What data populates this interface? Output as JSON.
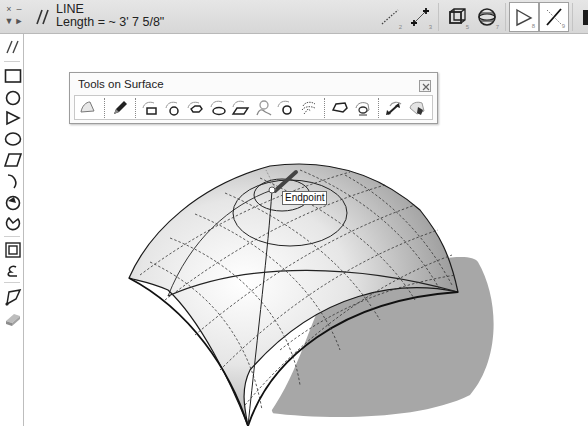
{
  "topbar": {
    "mini_controls": [
      "×",
      "–",
      "▼",
      "►"
    ],
    "tool_name": "LINE",
    "measurement": "Length = ~ 3' 7 5/8\"",
    "right_tools": [
      {
        "id": "line-dotted",
        "icon": "dotted-line-icon",
        "sub": "2",
        "active": false
      },
      {
        "id": "line-endpoints",
        "icon": "line-endpoints-icon",
        "sub": "3",
        "active": false
      },
      {
        "id": "box-3d",
        "icon": "box-3d-icon",
        "sub": "5",
        "active": false
      },
      {
        "id": "sphere",
        "icon": "sphere-icon",
        "sub": "7",
        "active": false
      },
      {
        "id": "triangle",
        "icon": "triangle-icon",
        "sub": "8",
        "active": true
      },
      {
        "id": "line-cross",
        "icon": "line-cross-icon",
        "sub": "9",
        "active": true
      },
      {
        "id": "solid-box",
        "icon": "solid-box-icon",
        "sub": "",
        "active": false
      }
    ]
  },
  "left_toolbar": {
    "items": [
      {
        "name": "line-tool",
        "icon": "double-slash-icon"
      },
      {
        "name": "rectangle-tool",
        "icon": "rectangle-icon"
      },
      {
        "name": "circle-tool",
        "icon": "circle-icon"
      },
      {
        "name": "polygon-tool",
        "icon": "triangle-icon"
      },
      {
        "name": "ellipse-tool",
        "icon": "ellipse-icon"
      },
      {
        "name": "parallelogram-tool",
        "icon": "parallelogram-icon"
      },
      {
        "name": "arc-tool",
        "icon": "arc-icon"
      },
      {
        "name": "circle-arc-tool",
        "icon": "circle-segment-icon"
      },
      {
        "name": "pie-tool",
        "icon": "pie-icon"
      },
      {
        "name": "offset-tool",
        "icon": "offset-square-icon"
      },
      {
        "name": "freehand-tool",
        "icon": "freehand-icon"
      },
      {
        "name": "polyline-tool",
        "icon": "polyline-icon"
      },
      {
        "name": "eraser-tool",
        "icon": "eraser-icon"
      }
    ]
  },
  "tools_on_surface": {
    "title": "Tools on Surface",
    "close_icon": "close-icon",
    "buttons": [
      "surface-select",
      "draw-line",
      "rectangle-on-surface",
      "circle-on-surface",
      "polygon-on-surface",
      "ellipse-on-surface",
      "parallelogram-on-surface",
      "freehand-on-surface",
      "arc-on-surface",
      "text-on-surface",
      "offset-on-surface",
      "geodesic-on-surface",
      "move-on-surface",
      "paint-on-surface"
    ]
  },
  "viewport": {
    "inference_tooltip": "Endpoint"
  },
  "colors": {
    "topbar_bg": "#dcdcdc",
    "surface_light": "#ffffff",
    "surface_shade": "#9a9a9a",
    "shadow": "#a8a8a8",
    "edge": "#1a1a1a"
  }
}
